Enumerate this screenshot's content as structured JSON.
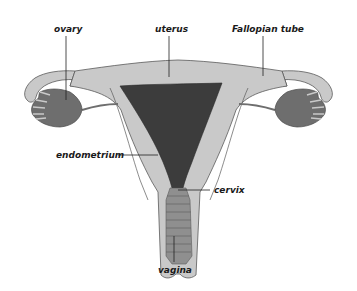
{
  "diagram": {
    "type": "anatomical illustration",
    "labels": {
      "ovary": "ovary",
      "uterus": "uterus",
      "fallopian_tube": "Fallopian tube",
      "endometrium": "endometrium",
      "cervix": "cervix",
      "vagina": "vagina"
    },
    "colors": {
      "background": "#ffffff",
      "tissue_light": "#c9c9c9",
      "tissue_mid": "#b3b3b3",
      "ovary": "#6e6e6e",
      "endometrium": "#3c3c3c",
      "vagina": "#8f8f8f",
      "outline": "#5a5a5a",
      "leader_line": "#222222"
    }
  }
}
